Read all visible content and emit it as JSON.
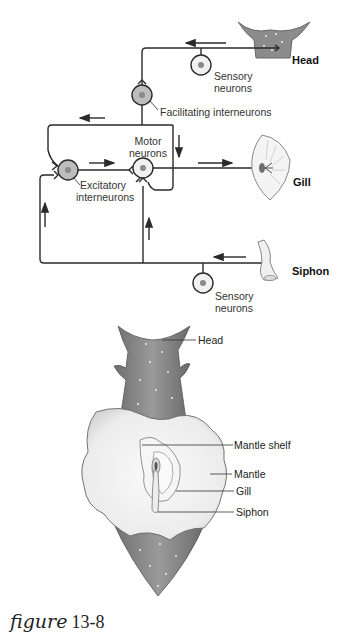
{
  "circuit": {
    "labels": {
      "head": "Head",
      "gill": "Gill",
      "siphon": "Siphon",
      "sensory_head_1": "Sensory",
      "sensory_head_2": "neurons",
      "facilitating": "Facilitating interneurons",
      "motor_1": "Motor",
      "motor_2": "neurons",
      "excitatory_1": "Excitatory",
      "excitatory_2": "interneurons",
      "sensory_siphon_1": "Sensory",
      "sensory_siphon_2": "neurons"
    }
  },
  "anatomy": {
    "labels": {
      "head": "Head",
      "mantle_shelf": "Mantle shelf",
      "mantle": "Mantle",
      "gill": "Gill",
      "siphon": "Siphon"
    }
  },
  "caption": {
    "word": "figure",
    "number": "13-8"
  },
  "colors": {
    "line": "#2a2a2a",
    "neuron_fill": "#e8e8e8",
    "neuron_fill_shaded": "#bdbdbd",
    "nucleus": "#8a8a8a",
    "tissue_dark": "#7a7a7a",
    "tissue_light": "#f2f2f2"
  }
}
